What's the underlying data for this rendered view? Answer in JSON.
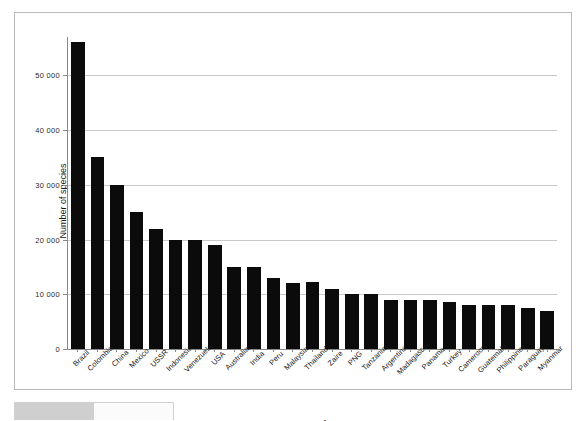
{
  "chart_data": {
    "type": "bar",
    "title": "",
    "xlabel": "Country",
    "ylabel": "Number of species",
    "ylim": [
      0,
      57000
    ],
    "grid": true,
    "legend": "none",
    "ytick_labels": [
      "0",
      "10 000",
      "20 000",
      "30 000",
      "40 000",
      "50 000"
    ],
    "ytick_values": [
      0,
      10000,
      20000,
      30000,
      40000,
      50000
    ],
    "categories": [
      "Brazil",
      "Colombia",
      "China",
      "Mexico",
      "USSR",
      "Indonesia",
      "Venezuela",
      "USA",
      "Australia",
      "India",
      "Peru",
      "Malaysia",
      "Thailand",
      "Zaire",
      "PNG",
      "Tanzania",
      "Argentina",
      "Madagascar",
      "Panama",
      "Turkey",
      "Cameroon",
      "Guatemala",
      "Philippines",
      "Paraguay",
      "Myanmar"
    ],
    "values": [
      56000,
      35000,
      30000,
      25000,
      22000,
      20000,
      20000,
      19000,
      15000,
      15000,
      13000,
      12000,
      12200,
      11000,
      10000,
      10000,
      9000,
      9000,
      9000,
      8500,
      8000,
      8000,
      8000,
      7500,
      7000
    ]
  },
  "bottom_ui": {
    "tab_label": ""
  }
}
